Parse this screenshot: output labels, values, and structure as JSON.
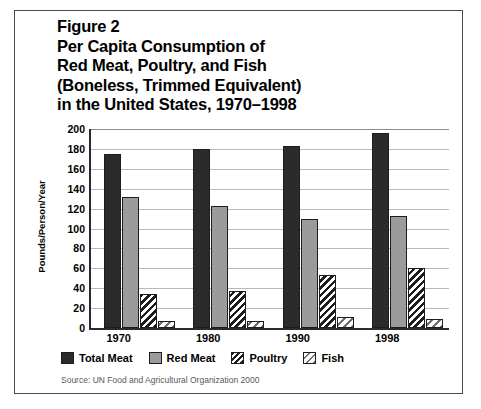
{
  "figure": {
    "title_lines": [
      "Figure 2",
      "Per Capita Consumption of",
      "Red Meat, Poultry, and Fish",
      "(Boneless, Trimmed Equivalent)",
      "in the United States, 1970–1998"
    ],
    "source_note": "Source: UN Food and Agricultural Organization 2000"
  },
  "chart_data": {
    "type": "bar",
    "title": "Figure 2 Per Capita Consumption of Red Meat, Poultry, and Fish (Boneless, Trimmed Equivalent) in the United States, 1970–1998",
    "xlabel": "",
    "ylabel": "Pounds/Person/Year",
    "categories": [
      "1970",
      "1980",
      "1990",
      "1998"
    ],
    "series": [
      {
        "name": "Total Meat",
        "color": "#2b2b2b",
        "pattern": "solid-dark",
        "values": [
          175,
          180,
          183,
          196
        ]
      },
      {
        "name": "Red Meat",
        "color": "#9b9b9b",
        "pattern": "solid-gray",
        "values": [
          132,
          123,
          110,
          113
        ]
      },
      {
        "name": "Poultry",
        "color": "#1d1d1d",
        "pattern": "diagonal-hatch-dense",
        "values": [
          34,
          37,
          53,
          60
        ]
      },
      {
        "name": "Fish",
        "color": "#6f6f6f",
        "pattern": "diagonal-hatch-light",
        "values": [
          7,
          7,
          11,
          9
        ]
      }
    ],
    "ylim": [
      0,
      200
    ],
    "yticks": [
      0,
      20,
      40,
      60,
      80,
      100,
      120,
      140,
      160,
      180,
      200
    ],
    "grid": true,
    "legend_position": "bottom"
  }
}
